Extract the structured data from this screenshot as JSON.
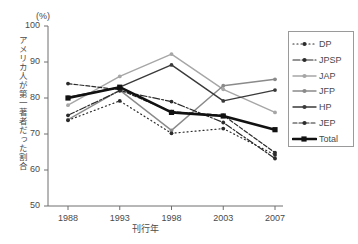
{
  "chart_data": {
    "type": "line",
    "title": "",
    "subtitle": "",
    "unit_label": "(%)",
    "xlabel": "刊行年",
    "ylabel": "アメリカ人が第一著者だった割合",
    "categories": [
      "1988",
      "1993",
      "1998",
      "2003",
      "2007"
    ],
    "x": [
      1988,
      1993,
      1998,
      2003,
      2007
    ],
    "ylim": [
      50,
      100
    ],
    "yticks": [
      50,
      60,
      70,
      80,
      90,
      100
    ],
    "ytick_labels": [
      "50",
      "60",
      "70",
      "80",
      "90",
      "100"
    ],
    "xtick_labels": [
      "1988",
      "1993",
      "1998",
      "2003",
      "2007"
    ],
    "grid": false,
    "legend_position": "right-outside",
    "series": [
      {
        "name": "DP",
        "values": [
          73.8,
          79.2,
          70.2,
          71.5,
          64.2
        ],
        "color": "#2b2b2b",
        "dash": "1,3",
        "width": 1.2,
        "marker": "circle"
      },
      {
        "name": "JPSP",
        "values": [
          75.2,
          82.0,
          79.0,
          73.2,
          63.2
        ],
        "color": "#2b2b2b",
        "dash": "7,2,2,2",
        "width": 1.2,
        "marker": "circle"
      },
      {
        "name": "JAP",
        "values": [
          78.0,
          86.0,
          92.2,
          82.4,
          76.0
        ],
        "color": "#a6a6a6",
        "dash": "none",
        "width": 1.4,
        "marker": "circle"
      },
      {
        "name": "JFP",
        "values": [
          74.0,
          82.2,
          71.0,
          83.4,
          85.2
        ],
        "color": "#8a8a8a",
        "dash": "none",
        "width": 1.4,
        "marker": "circle"
      },
      {
        "name": "HP",
        "values": [
          80.2,
          83.0,
          89.2,
          79.2,
          82.2
        ],
        "color": "#3a3a3a",
        "dash": "none",
        "width": 1.4,
        "marker": "circle"
      },
      {
        "name": "JEP",
        "values": [
          84.0,
          82.3,
          76.2,
          75.2,
          64.8
        ],
        "color": "#2b2b2b",
        "dash": "4,2",
        "width": 1.2,
        "marker": "circle"
      },
      {
        "name": "Total",
        "values": [
          80.0,
          83.0,
          76.0,
          75.0,
          71.2
        ],
        "color": "#111111",
        "dash": "none",
        "width": 2.6,
        "marker": "square"
      }
    ],
    "annotations": []
  },
  "legend": {
    "items": [
      {
        "label": "DP"
      },
      {
        "label": "JPSP"
      },
      {
        "label": "JAP"
      },
      {
        "label": "JFP"
      },
      {
        "label": "HP"
      },
      {
        "label": "JEP"
      },
      {
        "label": "Total"
      }
    ]
  },
  "axes": {
    "y_tick_0": "50",
    "y_tick_1": "60",
    "y_tick_2": "70",
    "y_tick_3": "80",
    "y_tick_4": "90",
    "y_tick_5": "100",
    "x_tick_0": "1988",
    "x_tick_1": "1993",
    "x_tick_2": "1998",
    "x_tick_3": "2003",
    "x_tick_4": "2007"
  }
}
